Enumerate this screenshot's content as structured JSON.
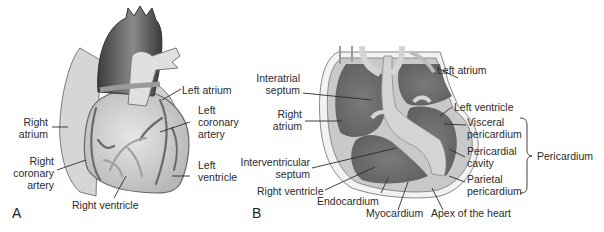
{
  "figure": {
    "panels": [
      {
        "id": "A",
        "letter": "A",
        "title": "External anterior view of the heart",
        "labels": {
          "left_atrium": "Left atrium",
          "right_atrium_1": "Right",
          "right_atrium_2": "atrium",
          "left_coronary_1": "Left",
          "left_coronary_2": "coronary",
          "left_coronary_3": "artery",
          "right_coronary_1": "Right",
          "right_coronary_2": "coronary",
          "right_coronary_3": "artery",
          "left_ventricle_1": "Left",
          "left_ventricle_2": "ventricle",
          "right_ventricle": "Right ventricle"
        }
      },
      {
        "id": "B",
        "letter": "B",
        "title": "Internal section with heart wall layers",
        "labels": {
          "interatrial_1": "Interatrial",
          "interatrial_2": "septum",
          "right_atrium_1": "Right",
          "right_atrium_2": "atrium",
          "interventricular_1": "Interventricular",
          "interventricular_2": "septum",
          "right_ventricle": "Right ventricle",
          "endocardium": "Endocardium",
          "myocardium": "Myocardium",
          "apex": "Apex of the heart",
          "left_atrium": "Left atrium",
          "left_ventricle": "Left ventricle",
          "visceral_1": "Visceral",
          "visceral_2": "pericardium",
          "cavity_1": "Pericardial",
          "cavity_2": "cavity",
          "parietal_1": "Parietal",
          "parietal_2": "pericardium",
          "pericardium": "Pericardium"
        }
      }
    ],
    "colors": {
      "background": "#ffffff",
      "chamber_dark": "#6e6e6e",
      "tissue_light": "#c8c8c8",
      "aorta": "#555555",
      "label_text": "#2b2b2b"
    }
  }
}
